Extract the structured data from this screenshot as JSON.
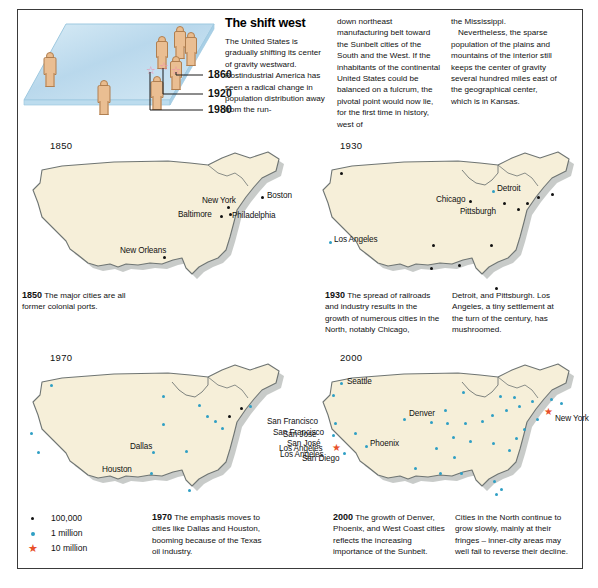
{
  "headline": "The shift west",
  "intro_columns": {
    "col1": "The United States is gradually shifting its center of gravity westward. Postindustrial America has seen a radical change in population distribution away from the run-",
    "col2": "down northeast manufacturing belt toward the Sunbelt cities of the South and the West. If the inhabitants of the continental United States could be balanced on a fulcrum, the pivotal point would now lie, for the first time in history, west of",
    "col3_a": "the Mississippi.",
    "col3_b": "Nevertheless, the sparse population of the plains and mountains of the interior still keeps the center of gravity several hundred miles east of the geographical center, which is in Kansas."
  },
  "diagram": {
    "name": "center-of-gravity-plane",
    "plane_color": "#c6e0f0",
    "figure_color": "#eabe92",
    "star_color": "#f08fae",
    "year_markers": [
      {
        "year": "1860"
      },
      {
        "year": "1920"
      },
      {
        "year": "1980"
      }
    ]
  },
  "maps": [
    {
      "id": "map-1850",
      "year": "1850",
      "cities": [
        {
          "name": "New York",
          "type": "100000"
        },
        {
          "name": "Boston",
          "type": "100000"
        },
        {
          "name": "Baltimore",
          "type": "100000"
        },
        {
          "name": "Philadelphia",
          "type": "100000"
        },
        {
          "name": "New Orleans",
          "type": "100000"
        }
      ],
      "caption_bold": "1850",
      "caption_text": " The major cities are all former colonial ports."
    },
    {
      "id": "map-1930",
      "year": "1930",
      "cities": [
        {
          "name": "Chicago",
          "type": "100000"
        },
        {
          "name": "Detroit",
          "type": "1million"
        },
        {
          "name": "Pittsburgh",
          "type": "100000"
        },
        {
          "name": "Los Angeles",
          "type": "1million"
        }
      ],
      "caption_bold": "1930",
      "caption_col1": " The spread of railroads and industry results in the growth of numerous cities in the North, notably Chicago,",
      "caption_col2": "Detroit, and Pittsburgh. Los Angeles, a tiny settlement at the turn of the century, has mushroomed."
    },
    {
      "id": "map-1970",
      "year": "1970",
      "cities": [
        {
          "name": "Dallas",
          "type": "1million"
        },
        {
          "name": "Houston",
          "type": "1million"
        },
        {
          "name": "San Francisco",
          "type": "1million"
        },
        {
          "name": "San José",
          "type": "1million"
        },
        {
          "name": "Los Angeles",
          "type": "1million"
        }
      ],
      "caption_bold": "1970",
      "caption_text": " The emphasis moves to cities like Dallas and Houston, booming because of the Texas oil industry."
    },
    {
      "id": "map-2000",
      "year": "2000",
      "cities": [
        {
          "name": "Seattle",
          "type": "1million"
        },
        {
          "name": "Denver",
          "type": "1million"
        },
        {
          "name": "New York",
          "type": "10million"
        },
        {
          "name": "San Francisco",
          "type": "1million"
        },
        {
          "name": "San José",
          "type": "1million"
        },
        {
          "name": "Los Angeles",
          "type": "10million"
        },
        {
          "name": "San Diego",
          "type": "1million"
        },
        {
          "name": "Phoenix",
          "type": "1million"
        }
      ],
      "caption_bold": "2000",
      "caption_col1": " The growth of Denver, Phoenix, and West Coast cities reflects the increasing importance of the Sunbelt.",
      "caption_col2": "Cities in the North continue to grow slowly, mainly at their fringes – inner-city areas may well fail to reverse their decline."
    }
  ],
  "legend": {
    "items": [
      {
        "label": "100,000",
        "marker": "black-dot",
        "color": "#111111"
      },
      {
        "label": "1 million",
        "marker": "blue-dot",
        "color": "#2f9fc4"
      },
      {
        "label": "10 million",
        "marker": "red-star",
        "color": "#e8502a"
      }
    ]
  },
  "colors": {
    "map_fill": "#f6efd9",
    "map_stroke": "#6f7573",
    "map_shadow": "#9aa19c"
  }
}
